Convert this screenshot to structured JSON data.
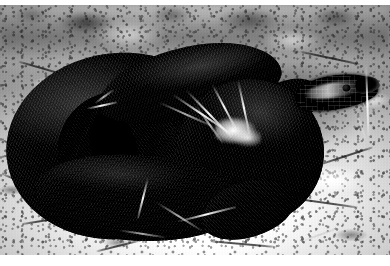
{
  "image": {
    "kind": "photograph",
    "medium": "black-and-white nature photograph",
    "width_px": 390,
    "height_px": 266,
    "caption": "",
    "border": {
      "top_margin_px": 5,
      "bottom_margin_px": 11,
      "color": "#ffffff"
    },
    "palette": {
      "snake_black": "#090909",
      "snake_highlight": "#d7d7d7",
      "rock_light": "#f4f4f4",
      "rock_mid": "#b4b4b4",
      "rock_shadow": "#5a5a5a",
      "background_blur": "#7c7c7c",
      "straw_light": "#f2f2f2",
      "frame_white": "#ffffff"
    }
  },
  "subject": {
    "name": "coiled black snake",
    "common_name": "adder",
    "scientific_hint": "Vipera berus (melanistic)",
    "pose": "tightly coiled with head raised at right",
    "scale_pattern": "fine diagonal keeled scale rows",
    "head_direction": "right",
    "eye_position": "upper right of head"
  },
  "scene": {
    "substrate": "pale mottled limestone rock",
    "vegetation": "dry pale grass blades and straw",
    "lighting": "strong directional sunlight from upper right",
    "background": "out-of-focus dark gray band along the top edge"
  },
  "regions": [
    {
      "id": "coil-outer-left",
      "label": "large outer body coil (left)"
    },
    {
      "id": "coil-inner",
      "label": "inner coil loop"
    },
    {
      "id": "coil-lower",
      "label": "lower body coil"
    },
    {
      "id": "coil-right",
      "label": "right body coil"
    },
    {
      "id": "snake-neck",
      "label": "raised neck"
    },
    {
      "id": "snake-head",
      "label": "head"
    },
    {
      "id": "rock-foreground",
      "label": "sunlit rock foreground"
    },
    {
      "id": "rock-background",
      "label": "blurred rock background"
    },
    {
      "id": "straw-cluster",
      "label": "dry grass cluster over coils"
    }
  ]
}
